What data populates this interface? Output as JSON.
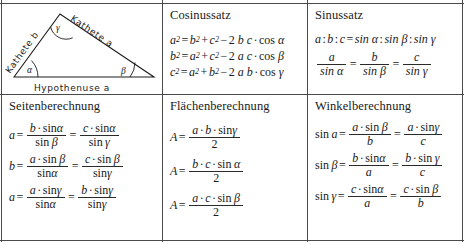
{
  "document": {
    "title": "Trigonometrie Formelsammlung",
    "cells": [
      {
        "id": "triangle",
        "title": ""
      },
      {
        "id": "cosinussatz",
        "title": "Cosinussatz"
      },
      {
        "id": "sinussatz",
        "title": "Sinussatz"
      },
      {
        "id": "seitenberechnung",
        "title": "Seitenberechnung"
      },
      {
        "id": "flaechenberechnung",
        "title": "Flächenberechnung"
      },
      {
        "id": "winkelberechnung",
        "title": "Winkelberechnung"
      }
    ]
  },
  "triangle": {
    "side_labels": {
      "left": "Kathete b",
      "right": "Kathete a",
      "base": "Hypothenuse a"
    },
    "angle_labels": {
      "bottom_left": "α",
      "apex": "γ",
      "bottom_right": "β"
    }
  },
  "cosinussatz": {
    "title": "Cosinussatz",
    "lines": [
      {
        "lhs": "a",
        "lhs_sup": "2",
        "t1": "b",
        "t1_sup": "2",
        "t2": "c",
        "t2_sup": "2",
        "coef": "2",
        "f1": "b",
        "f2": "c",
        "angle": "α"
      },
      {
        "lhs": "b",
        "lhs_sup": "2",
        "t1": "a",
        "t1_sup": "2",
        "t2": "c",
        "t2_sup": "2",
        "coef": "2",
        "f1": "a",
        "f2": "c",
        "angle": "β"
      },
      {
        "lhs": "c",
        "lhs_sup": "2",
        "t1": "a",
        "t1_sup": "2",
        "t2": "b",
        "t2_sup": "2",
        "coef": "2",
        "f1": "a",
        "f2": "b",
        "angle": "γ"
      }
    ],
    "ops": {
      "eq": "=",
      "plus": "+",
      "minus": "−",
      "dot": "·",
      "cos": "cos"
    }
  },
  "sinussatz": {
    "title": "Sinussatz",
    "proportion": {
      "left": [
        "a",
        "b",
        "c"
      ],
      "right": [
        "sin α",
        "sin β",
        "sin γ"
      ],
      "sep": ":",
      "eq": "="
    },
    "fractions": [
      {
        "num": "a",
        "den": "sin α"
      },
      {
        "num": "b",
        "den": "sin β"
      },
      {
        "num": "c",
        "den": "sin γ"
      }
    ]
  },
  "seitenberechnung": {
    "title": "Seitenberechnung",
    "lines": [
      {
        "lhs": "a",
        "f1": {
          "num_a": "b",
          "num_fn": "sin",
          "num_g": "α",
          "den_fn": "sin",
          "den_g": "β"
        },
        "f2": {
          "num_a": "c",
          "num_fn": "sin",
          "num_g": "α",
          "den_fn": "sin",
          "den_g": "γ"
        }
      },
      {
        "lhs": "b",
        "f1": {
          "num_a": "a",
          "num_fn": "sin",
          "num_g": "β",
          "den_fn": "sin",
          "den_g": "α"
        },
        "f2": {
          "num_a": "c",
          "num_fn": "sin",
          "num_g": "β",
          "den_fn": "sin",
          "den_g": "γ"
        }
      },
      {
        "lhs": "a",
        "f1": {
          "num_a": "a",
          "num_fn": "sin",
          "num_g": "γ",
          "den_fn": "sin",
          "den_g": "α"
        },
        "f2": {
          "num_a": "b",
          "num_fn": "sin",
          "num_g": "γ",
          "den_fn": "sin",
          "den_g": "γ"
        }
      }
    ],
    "ops": {
      "eq": "=",
      "dot": "·"
    }
  },
  "flaechenberechnung": {
    "title": "Flächenberechnung",
    "lines": [
      {
        "lhs": "A",
        "s1": "a",
        "s2": "b",
        "fn": "sin",
        "angle": "γ",
        "den": "2"
      },
      {
        "lhs": "A",
        "s1": "b",
        "s2": "c",
        "fn": "sin",
        "angle": "α",
        "den": "2"
      },
      {
        "lhs": "A",
        "s1": "a",
        "s2": "c",
        "fn": "sin",
        "angle": "β",
        "den": "2"
      }
    ],
    "ops": {
      "eq": "=",
      "dot": "·"
    }
  },
  "winkelberechnung": {
    "title": "Winkelberechnung",
    "lines": [
      {
        "lhs_fn": "sin",
        "lhs_g": "a",
        "f1": {
          "num_a": "a",
          "num_fn": "sin",
          "num_g": "β",
          "den": "b"
        },
        "f2": {
          "num_a": "a",
          "num_fn": "sin",
          "num_g": "γ",
          "den": "c"
        }
      },
      {
        "lhs_fn": "sin",
        "lhs_g": "β",
        "f1": {
          "num_a": "b",
          "num_fn": "sin",
          "num_g": "α",
          "den": "a"
        },
        "f2": {
          "num_a": "b",
          "num_fn": "sin",
          "num_g": "γ",
          "den": "c"
        }
      },
      {
        "lhs_fn": "sin",
        "lhs_g": "γ",
        "f1": {
          "num_a": "c",
          "num_fn": "sin",
          "num_g": "α",
          "den": "a"
        },
        "f2": {
          "num_a": "c",
          "num_fn": "sin",
          "num_g": "β",
          "den": "b"
        }
      }
    ],
    "ops": {
      "eq": "=",
      "dot": "·"
    }
  },
  "colors": {
    "rule": "#4a4a4a",
    "ink": "#1a1a1a",
    "paper": "#ffffff"
  }
}
